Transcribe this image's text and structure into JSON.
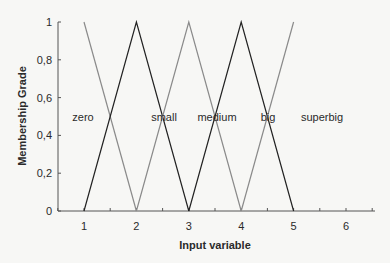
{
  "chart_data": {
    "type": "line",
    "title": "",
    "xlabel": "Input variable",
    "ylabel": "Membership Grade",
    "xlim": [
      0.5,
      6.55
    ],
    "ylim": [
      0,
      1
    ],
    "xticks": [
      1,
      2,
      3,
      4,
      5,
      6
    ],
    "xtick_labels": [
      "1",
      "2",
      "3",
      "4",
      "5",
      "6"
    ],
    "yticks": [
      0,
      0.2,
      0.4,
      0.6,
      0.8,
      1
    ],
    "ytick_labels": [
      "0",
      "0,2",
      "0,4",
      "0,6",
      "0,8",
      "1"
    ],
    "grid": false,
    "legend": "inline labels at y=0.5",
    "series": [
      {
        "name": "zero",
        "x": [
          1,
          2
        ],
        "y": [
          1,
          0
        ],
        "color": "#8a8a8a"
      },
      {
        "name": "small",
        "x": [
          1,
          2,
          3
        ],
        "y": [
          0,
          1,
          0
        ],
        "color": "#222222"
      },
      {
        "name": "medium",
        "x": [
          2,
          3,
          4
        ],
        "y": [
          0,
          1,
          0
        ],
        "color": "#8a8a8a"
      },
      {
        "name": "big",
        "x": [
          3,
          4,
          5
        ],
        "y": [
          0,
          1,
          0
        ],
        "color": "#222222"
      },
      {
        "name": "superbig",
        "x": [
          4,
          5
        ],
        "y": [
          0,
          1
        ],
        "color": "#8a8a8a"
      }
    ],
    "annotations": [
      {
        "text": "zero",
        "x": 1.25,
        "y": 0.5
      },
      {
        "text": "small",
        "x": 2.0,
        "y": 0.5
      },
      {
        "text": "medium",
        "x": 3.0,
        "y": 0.5
      },
      {
        "text": "big",
        "x": 4.0,
        "y": 0.5
      },
      {
        "text": "superbig",
        "x": 5.0,
        "y": 0.5
      }
    ]
  }
}
